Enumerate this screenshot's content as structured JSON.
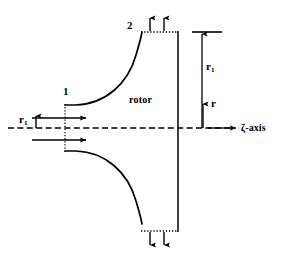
{
  "figure": {
    "type": "meridional-section-rotor-diagram",
    "background_color": "#ffffff",
    "line_color": "#000000",
    "width": 286,
    "height": 257
  },
  "labels": {
    "station_1": "1",
    "station_2": "2",
    "rotor": "rotor",
    "radius_inlet_left": "r",
    "radius_inlet_left_sub": "1",
    "radius_inlet_right": "r",
    "radius_inlet_right_sub": "1",
    "radial_coordinate": "r",
    "axial_axis": "ζ-axis"
  },
  "geometry": {
    "centerline_y": 128,
    "centerline_x_start": 8,
    "centerline_x_end": 236,
    "shroud_right_x": 178,
    "shroud_top_y": 32,
    "shroud_bottom_y": 231,
    "hub_leading_edge_x": 65,
    "hub_upper_y": 105,
    "hub_lower_y": 151,
    "blade_tip_upper_x": 142,
    "blade_tip_lower_x": 142,
    "dimension_line_x": 202,
    "dimension_tick_x_start": 192,
    "dimension_tick_x_end": 222,
    "r_arrow_x": 203,
    "r_arrow_top_y": 105,
    "inlet_arrow_upper_y": 118,
    "inlet_arrow_lower_y": 140,
    "inlet_arrow_x_start": 30,
    "inlet_arrow_x_end": 88,
    "outlet_arrow_x_1": 150,
    "outlet_arrow_x_2": 165,
    "outlet_arrow_top_y": 18,
    "outlet_arrow_bottom_y": 245
  },
  "icons": {
    "flow_inlet_arrow": "arrow-right-icon",
    "flow_outlet_arrow_top": "arrow-up-icon",
    "flow_outlet_arrow_bottom": "arrow-down-icon",
    "axis_arrow": "arrow-right-icon",
    "radial_arrow": "arrow-up-icon",
    "dimension_arrow": "arrow-up-icon"
  }
}
